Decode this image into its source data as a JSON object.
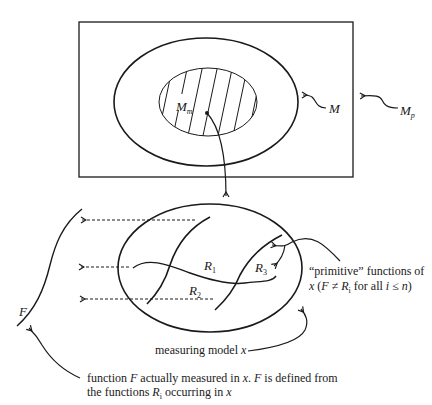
{
  "diagram": {
    "colors": {
      "ink": "#1a1a1a",
      "background": "#ffffff"
    },
    "top": {
      "rect_label": {
        "main": "M",
        "sub": "p"
      },
      "outer_set_label": "M",
      "inner_set_label": {
        "main": "M",
        "sub": "m"
      }
    },
    "bottom": {
      "functions": [
        {
          "main": "R",
          "sub": "1"
        },
        {
          "main": "R",
          "sub": "2"
        },
        {
          "main": "R",
          "sub": "3"
        }
      ],
      "measured_function_label": "F",
      "primitive_note_line1": "“primitive” functions of",
      "primitive_note_line2_a": "x",
      "primitive_note_line2_b": " (",
      "primitive_note_line2_c": "F",
      "primitive_note_line2_d": " ≠ ",
      "primitive_note_line2_e": "R",
      "primitive_note_line2_f": "i",
      "primitive_note_line2_g": " for all ",
      "primitive_note_line2_h": "i",
      "primitive_note_line2_i": " ≤ ",
      "primitive_note_line2_j": "n",
      "primitive_note_line2_k": ")",
      "model_note_a": "measuring model ",
      "model_note_b": "x",
      "function_note_l1_a": "function ",
      "function_note_l1_b": "F",
      "function_note_l1_c": " actually measured in ",
      "function_note_l1_d": "x",
      "function_note_l1_e": ". ",
      "function_note_l1_f": "F",
      "function_note_l1_g": " is defined from",
      "function_note_l2_a": "the functions ",
      "function_note_l2_b": "R",
      "function_note_l2_c": "i",
      "function_note_l2_d": " occurring in ",
      "function_note_l2_e": "x"
    }
  }
}
